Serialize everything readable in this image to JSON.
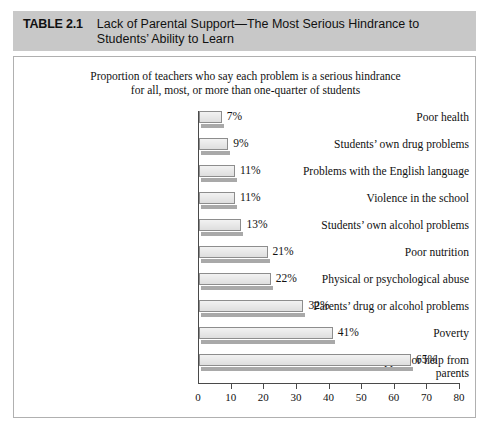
{
  "table": {
    "number_label": "TABLE 2.1",
    "title": "Lack of Parental Support—The Most Serious Hindrance to Students’ Ability to Learn",
    "header_bg": "#c8c8c8"
  },
  "chart_data": {
    "type": "bar",
    "orientation": "horizontal",
    "title": "",
    "subtitle": "Proportion of teachers who say each problem is a serious hindrance for all, most, or more than one-quarter of students",
    "subtitle_line1": "Proportion of teachers who say each problem is a serious hindrance",
    "subtitle_line2": "for all, most, or more than one-quarter of students",
    "categories": [
      "Poor health",
      "Students’ own drug problems",
      "Problems with the English language",
      "Violence in the school",
      "Students’ own alcohol problems",
      "Poor nutrition",
      "Physical or psychological abuse",
      "Parents’ drug or alcohol problems",
      "Poverty",
      "Lack of support or help from parents"
    ],
    "values": [
      7,
      9,
      11,
      11,
      13,
      21,
      22,
      32,
      41,
      65
    ],
    "value_labels": [
      "7%",
      "9%",
      "11%",
      "11%",
      "13%",
      "21%",
      "22%",
      "32%",
      "41%",
      "65%"
    ],
    "xlabel": "",
    "ylabel": "",
    "xlim": [
      0,
      80
    ],
    "xticks": [
      0,
      10,
      20,
      30,
      40,
      50,
      60,
      70,
      80
    ],
    "xtick_labels": [
      "0",
      "10",
      "20",
      "30",
      "40",
      "50",
      "60",
      "70",
      "80"
    ],
    "grid": false,
    "legend": null,
    "bar_fill": "#e9e9e9",
    "bar_border": "#8d8d8d",
    "bar_shadow": "#a9a9a9"
  }
}
